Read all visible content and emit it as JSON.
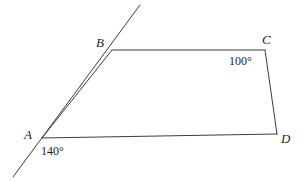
{
  "figure": {
    "kind": "geometry-diagram",
    "stroke_color": "#3c3c3c",
    "background_color": "#ffffff",
    "stroke_width": 1
  },
  "vertices": [
    {
      "id": "A",
      "label": "A",
      "x": 42,
      "y": 138,
      "label_x": 24,
      "label_y": 128
    },
    {
      "id": "B",
      "label": "B",
      "x": 112,
      "y": 50,
      "label_x": 96,
      "label_y": 36
    },
    {
      "id": "C",
      "label": "C",
      "x": 265,
      "y": 50,
      "label_x": 262,
      "label_y": 33
    },
    {
      "id": "D",
      "label": "D",
      "x": 277,
      "y": 134,
      "label_x": 281,
      "label_y": 132
    }
  ],
  "segments": [
    {
      "name": "segment-AB",
      "from": "A",
      "to": "B"
    },
    {
      "name": "segment-BC",
      "from": "B",
      "to": "C"
    },
    {
      "name": "segment-CD",
      "from": "C",
      "to": "D"
    },
    {
      "name": "segment-AD",
      "from": "A",
      "to": "D"
    }
  ],
  "transversal": {
    "name": "extended-line-through-A-and-B",
    "x1": 140,
    "y1": 5,
    "x2": 13,
    "y2": 177
  },
  "angles": [
    {
      "name": "angle-at-A",
      "at_vertex": "A",
      "value": "140°",
      "label_x": 41,
      "label_y": 145
    },
    {
      "name": "angle-at-C",
      "at_vertex": "C",
      "value": "100°",
      "label_x": 229,
      "label_y": 55
    }
  ],
  "labels": {
    "A": "A",
    "B": "B",
    "C": "C",
    "D": "D",
    "angle_A": "140°",
    "angle_C": "100°"
  }
}
